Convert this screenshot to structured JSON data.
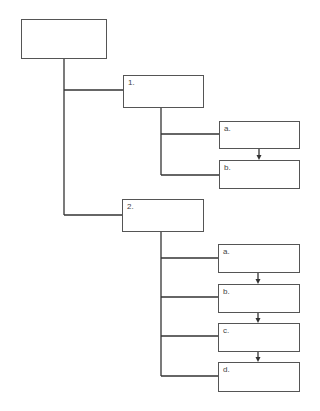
{
  "diagram": {
    "root": {
      "label": ""
    },
    "branches": [
      {
        "label": "1.",
        "children": [
          {
            "label": "a."
          },
          {
            "label": "b."
          }
        ]
      },
      {
        "label": "2.",
        "children": [
          {
            "label": "a."
          },
          {
            "label": "b."
          },
          {
            "label": "c."
          },
          {
            "label": "d."
          }
        ]
      }
    ]
  }
}
